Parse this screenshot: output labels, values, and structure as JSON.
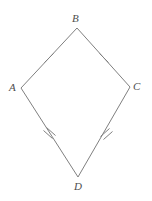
{
  "figure": {
    "shape_type": "kite",
    "background_color": "#ffffff",
    "stroke_color": "#808080",
    "stroke_width": 1,
    "label_color": "#4d4d4d",
    "vertices": [
      {
        "name": "A",
        "label": "A",
        "x": 21,
        "y": 88,
        "label_x": 9,
        "label_y": 82
      },
      {
        "name": "B",
        "label": "B",
        "x": 77,
        "y": 28,
        "label_x": 72,
        "label_y": 13
      },
      {
        "name": "C",
        "label": "C",
        "x": 130,
        "y": 87,
        "label_x": 133,
        "label_y": 81
      },
      {
        "name": "D",
        "label": "D",
        "x": 78,
        "y": 177,
        "label_x": 74,
        "label_y": 181
      }
    ],
    "sides": [
      {
        "name": "AB",
        "from": "A",
        "to": "B",
        "ticks": 1
      },
      {
        "name": "BC",
        "from": "B",
        "to": "C",
        "ticks": 1
      },
      {
        "name": "CD",
        "from": "C",
        "to": "D",
        "ticks": 2
      },
      {
        "name": "DA",
        "from": "D",
        "to": "A",
        "ticks": 2
      }
    ],
    "tick_marks": [
      {
        "side": "AB",
        "count": 1,
        "x": 49,
        "y": 58
      },
      {
        "side": "BC",
        "count": 1,
        "x": 104,
        "y": 58
      },
      {
        "side": "CD",
        "count": 2,
        "x": 105,
        "y": 132
      },
      {
        "side": "DA",
        "count": 2,
        "x": 49,
        "y": 133
      }
    ],
    "polygon_points": "21,88 77,28 130,87 78,177"
  }
}
